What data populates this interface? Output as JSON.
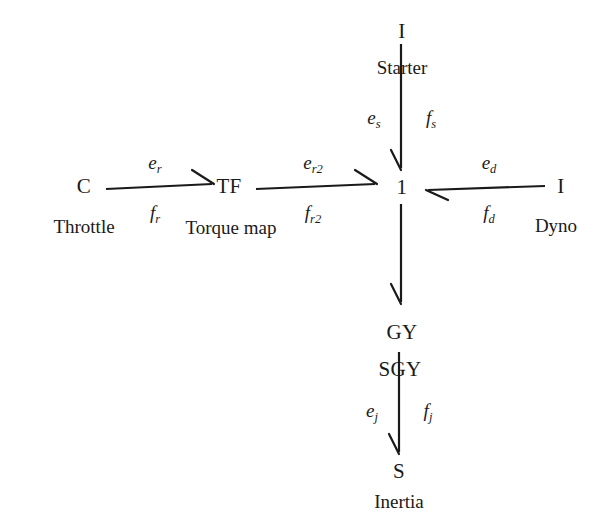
{
  "diagram": {
    "type": "bond-graph",
    "background": "#ffffff",
    "stroke_color": "#1a1a1a",
    "width": 604,
    "height": 523
  },
  "nodes": [
    {
      "id": "starter",
      "label": "I",
      "caption": "Starter",
      "x": 402,
      "y": 31,
      "caption_x": 402,
      "caption_y": 68
    },
    {
      "id": "throttle",
      "label": "C",
      "caption": "Throttle",
      "x": 84,
      "y": 186,
      "caption_x": 84,
      "caption_y": 227
    },
    {
      "id": "torquemap",
      "label": "TF",
      "caption": "Torque map",
      "x": 229,
      "y": 186,
      "caption_x": 231,
      "caption_y": 228
    },
    {
      "id": "junction",
      "label": "1",
      "caption": "",
      "x": 402,
      "y": 187,
      "caption_x": 402,
      "caption_y": 187
    },
    {
      "id": "dyno",
      "label": "I",
      "caption": "Dyno",
      "x": 561,
      "y": 186,
      "caption_x": 556,
      "caption_y": 226
    },
    {
      "id": "gy",
      "label": "GY",
      "caption": "",
      "x": 402,
      "y": 332,
      "caption_x": 402,
      "caption_y": 332
    },
    {
      "id": "sgy",
      "label": "SGY",
      "caption": "",
      "x": 400,
      "y": 369,
      "caption_x": 400,
      "caption_y": 369
    },
    {
      "id": "inertia",
      "label": "S",
      "caption": "Inertia",
      "x": 399,
      "y": 471,
      "caption_x": 399,
      "caption_y": 502
    }
  ],
  "bonds": [
    {
      "id": "bond-starter",
      "from": "starter",
      "to": "junction",
      "effort": "e",
      "effort_sub": "s",
      "flow": "f",
      "flow_sub": "s",
      "effort_x": 374,
      "effort_y": 118,
      "flow_x": 431,
      "flow_y": 118,
      "direction": "down"
    },
    {
      "id": "bond-throttle",
      "from": "throttle",
      "to": "torquemap",
      "effort": "e",
      "effort_sub": "r",
      "flow": "f",
      "flow_sub": "r",
      "effort_x": 155,
      "effort_y": 163,
      "flow_x": 155,
      "flow_y": 213,
      "direction": "right"
    },
    {
      "id": "bond-torquemap",
      "from": "torquemap",
      "to": "junction",
      "effort": "e",
      "effort_sub": "r2",
      "flow": "f",
      "flow_sub": "r2",
      "effort_x": 313,
      "effort_y": 163,
      "flow_x": 313,
      "flow_y": 213,
      "direction": "right"
    },
    {
      "id": "bond-dyno",
      "from": "dyno",
      "to": "junction",
      "effort": "e",
      "effort_sub": "d",
      "flow": "f",
      "flow_sub": "d",
      "effort_x": 489,
      "effort_y": 163,
      "flow_x": 489,
      "flow_y": 213,
      "direction": "left"
    },
    {
      "id": "bond-junction-gy",
      "from": "junction",
      "to": "gy",
      "effort": "",
      "effort_sub": "",
      "flow": "",
      "flow_sub": "",
      "effort_x": 0,
      "effort_y": 0,
      "flow_x": 0,
      "flow_y": 0,
      "direction": "down"
    },
    {
      "id": "bond-inertia",
      "from": "sgy",
      "to": "inertia",
      "effort": "e",
      "effort_sub": "j",
      "flow": "f",
      "flow_sub": "j",
      "effort_x": 372,
      "effort_y": 411,
      "flow_x": 428,
      "flow_y": 411,
      "direction": "down"
    }
  ]
}
